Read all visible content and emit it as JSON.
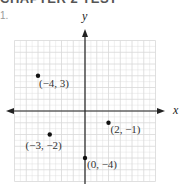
{
  "header": {
    "heading": "CHAPTER 2 TEST",
    "item_number": "1."
  },
  "chart_data": {
    "type": "scatter",
    "title": "",
    "xlabel": "x",
    "ylabel": "y",
    "xlim": [
      -6,
      6
    ],
    "ylim": [
      -6,
      6
    ],
    "grid": true,
    "legend": "none",
    "points": [
      {
        "x": -4,
        "y": 3,
        "label": "(−4, 3)"
      },
      {
        "x": -3,
        "y": -2,
        "label": "(−3, −2)"
      },
      {
        "x": 2,
        "y": -1,
        "label": "(2, −1)"
      },
      {
        "x": 0,
        "y": -4,
        "label": "(0, −4)"
      }
    ]
  },
  "colors": {
    "grid": "#d8d8d8",
    "axis": "#222222",
    "point": "#111111"
  }
}
